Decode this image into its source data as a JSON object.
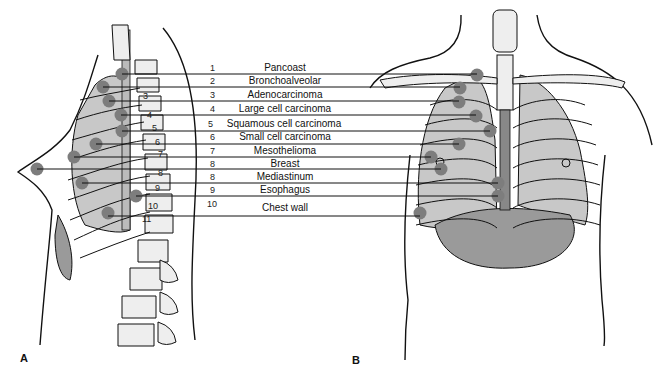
{
  "figure": {
    "panel_labels": [
      "A",
      "B"
    ],
    "legend": [
      {
        "number": "1",
        "label": "Pancoast"
      },
      {
        "number": "2",
        "label": "Bronchoalveolar"
      },
      {
        "number": "3",
        "label": "Adenocarcinoma"
      },
      {
        "number": "4",
        "label": "Large cell carcinoma"
      },
      {
        "number": "5",
        "label": "Squamous cell carcinoma"
      },
      {
        "number": "6",
        "label": "Small cell carcinoma"
      },
      {
        "number": "7",
        "label": "Mesothelioma"
      },
      {
        "number": "8",
        "label": "Breast"
      },
      {
        "number": "8",
        "label": "Mediastinum"
      },
      {
        "number": "9",
        "label": "Esophagus"
      },
      {
        "number": "10",
        "label": "Chest wall"
      }
    ],
    "vertebra_labels": [
      "3",
      "4",
      "5",
      "6",
      "7",
      "8",
      "9",
      "10",
      "11"
    ],
    "colors": {
      "lesion_dot": "#7d7d7d",
      "lung_fill": "#c8c8c8",
      "organ_fill": "#9a9a9a",
      "line": "#111111"
    }
  }
}
